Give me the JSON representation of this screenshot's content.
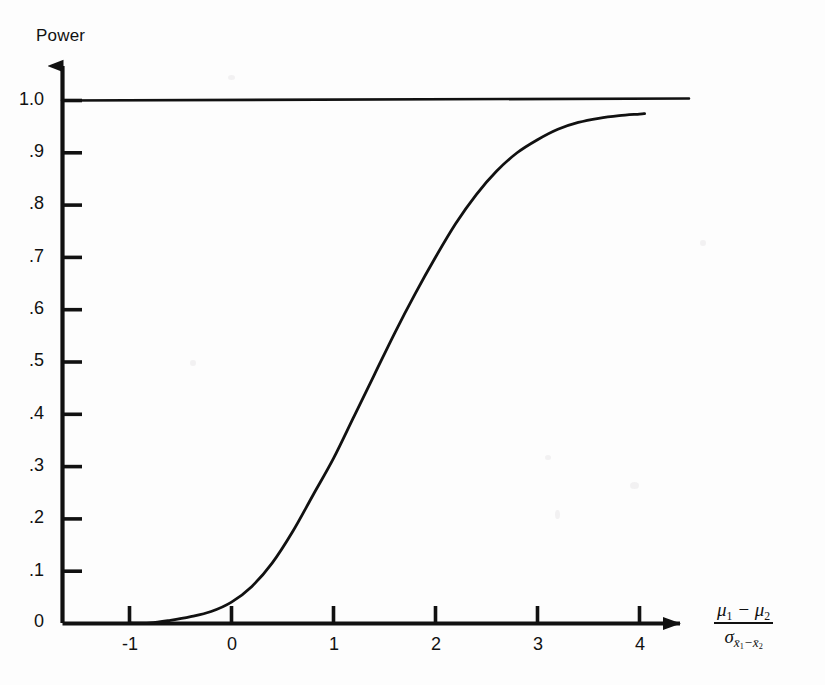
{
  "figure": {
    "background_color": "#fdfdfd",
    "ink_color": "#111111",
    "y_axis_title": "Power",
    "x_axis_label_numerator": "μ₁ − μ₂",
    "x_axis_label_denominator": "σ x̄₁ − x̄₂"
  },
  "chart_data": {
    "type": "line",
    "title": "",
    "xlabel": "(μ1 − μ2) / σ(x̄1 − x̄2)",
    "ylabel": "Power",
    "xlim": [
      -1.55,
      4.55
    ],
    "ylim": [
      0,
      1.03
    ],
    "grid": false,
    "legend": false,
    "x_ticks": [
      -1,
      0,
      1,
      2,
      3,
      4
    ],
    "x_tick_labels": [
      "-1",
      "0",
      "1",
      "2",
      "3",
      "4"
    ],
    "y_ticks": [
      0,
      0.1,
      0.2,
      0.3,
      0.4,
      0.5,
      0.6,
      0.7,
      0.8,
      0.9,
      1.0
    ],
    "y_tick_labels": [
      "0",
      ".1",
      ".2",
      ".3",
      ".4",
      ".5",
      ".6",
      ".7",
      ".8",
      ".9",
      "1.0"
    ],
    "series": [
      {
        "name": "Power function",
        "style": "solid",
        "color": "#111111",
        "x": [
          -1.0,
          -0.8,
          -0.6,
          -0.4,
          -0.2,
          0.0,
          0.2,
          0.4,
          0.6,
          0.8,
          1.0,
          1.2,
          1.4,
          1.6,
          1.8,
          2.0,
          2.2,
          2.4,
          2.6,
          2.8,
          3.0,
          3.2,
          3.4,
          3.6,
          3.8,
          4.0,
          4.05
        ],
        "y": [
          0.0,
          0.0,
          0.005,
          0.012,
          0.022,
          0.04,
          0.07,
          0.115,
          0.175,
          0.245,
          0.315,
          0.395,
          0.475,
          0.555,
          0.63,
          0.7,
          0.765,
          0.82,
          0.865,
          0.9,
          0.925,
          0.945,
          0.958,
          0.966,
          0.971,
          0.974,
          0.975
        ]
      },
      {
        "name": "Upper asymptote at power = 1.0",
        "style": "solid",
        "color": "#111111",
        "x": [
          -1.55,
          4.5
        ],
        "y": [
          1.0,
          1.0
        ]
      }
    ]
  }
}
